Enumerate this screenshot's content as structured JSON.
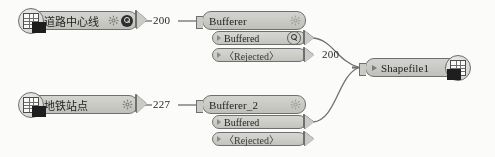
{
  "diagram": {
    "background_color": "#fbfbfa",
    "node_fill": "#cdcdc8",
    "node_border": "#6f6f6f"
  },
  "nodes": {
    "reader_road": {
      "title": "道路中心线",
      "icon": "dataset-table-icon",
      "gear": "gear-icon",
      "inspect": "magnifier-icon"
    },
    "reader_metro": {
      "title": "地铁站点",
      "icon": "dataset-table-icon",
      "gear": "gear-icon"
    },
    "bufferer1": {
      "title": "Bufferer",
      "gear": "gear-icon",
      "ports": [
        {
          "label": "Buffered",
          "inspect": "magnifier-icon"
        },
        {
          "label": "〈Rejected〉"
        }
      ]
    },
    "bufferer2": {
      "title": "Bufferer_2",
      "gear": "gear-icon",
      "ports": [
        {
          "label": "Buffered"
        },
        {
          "label": "〈Rejected〉"
        }
      ]
    },
    "writer_shapefile": {
      "title": "Shapefile1",
      "gear": "gear-icon",
      "icon": "dataset-table-icon"
    }
  },
  "connections": {
    "road_to_bufferer1": "200",
    "metro_to_bufferer2": "227",
    "buffered_to_shapefile": "200"
  }
}
